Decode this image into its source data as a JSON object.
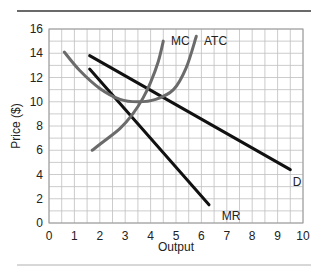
{
  "chart_data": {
    "type": "line",
    "title": "",
    "xlabel": "Output",
    "ylabel": "Price ($)",
    "xlim": [
      0,
      10
    ],
    "ylim": [
      0,
      16
    ],
    "xticks": [
      0,
      1,
      2,
      3,
      4,
      5,
      6,
      7,
      8,
      9,
      10
    ],
    "yticks": [
      0,
      2,
      4,
      6,
      8,
      10,
      12,
      14,
      16
    ],
    "grid": {
      "on": true,
      "x_step": 0.5,
      "y_step": 1
    },
    "legend": "none (inline curve labels)",
    "series": [
      {
        "name": "D",
        "color": "#111111",
        "style": "straight",
        "points": [
          [
            1.6,
            13.8
          ],
          [
            9.5,
            4.4
          ]
        ],
        "label_pos": [
          9.6,
          3.4
        ]
      },
      {
        "name": "MR",
        "color": "#111111",
        "style": "straight",
        "points": [
          [
            1.6,
            12.7
          ],
          [
            6.3,
            1.5
          ]
        ],
        "label_pos": [
          6.8,
          0.6
        ]
      },
      {
        "name": "MC",
        "color": "#6b6b6b",
        "style": "curve",
        "points": [
          [
            1.7,
            6.0
          ],
          [
            2.2,
            6.8
          ],
          [
            2.8,
            7.8
          ],
          [
            3.3,
            9.0
          ],
          [
            3.7,
            10.3
          ],
          [
            4.0,
            11.6
          ],
          [
            4.3,
            13.3
          ],
          [
            4.5,
            15.0
          ]
        ],
        "label_pos": [
          4.8,
          15.0
        ]
      },
      {
        "name": "ATC",
        "color": "#6b6b6b",
        "style": "curve",
        "points": [
          [
            0.6,
            14.1
          ],
          [
            1.2,
            12.6
          ],
          [
            2.0,
            11.1
          ],
          [
            2.8,
            10.2
          ],
          [
            3.5,
            10.0
          ],
          [
            4.2,
            10.2
          ],
          [
            4.9,
            11.0
          ],
          [
            5.4,
            12.8
          ],
          [
            5.8,
            15.4
          ]
        ],
        "label_pos": [
          6.1,
          15.0
        ]
      }
    ]
  },
  "layout": {
    "plot_left": 49,
    "plot_top": 29,
    "plot_right": 303,
    "plot_bottom": 223,
    "top_rule_color": "#666666",
    "bottom_rule_color": "#aaaaaa",
    "grid_color": "#bfbfbf"
  }
}
